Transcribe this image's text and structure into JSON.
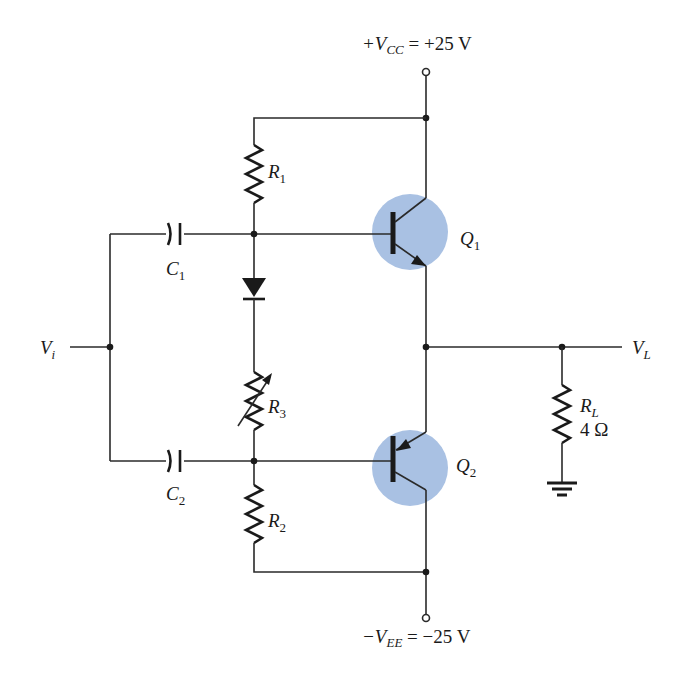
{
  "diagram": {
    "title": "",
    "type": "circuit-schematic",
    "colors": {
      "wire": "#2a2a2a",
      "transistor_highlight": "#a9c1e3",
      "background": "#ffffff"
    },
    "supplies": {
      "vcc": {
        "prefix": "+V",
        "sub": "CC",
        "value": " = +25 V"
      },
      "vee": {
        "prefix": "−V",
        "sub": "EE",
        "value": " = −25 V"
      }
    },
    "input": {
      "name": "V",
      "sub": "i"
    },
    "output": {
      "name": "V",
      "sub": "L"
    },
    "components": {
      "r1": {
        "name": "R",
        "sub": "1"
      },
      "r2": {
        "name": "R",
        "sub": "2"
      },
      "r3": {
        "name": "R",
        "sub": "3",
        "variable": true
      },
      "rl": {
        "name": "R",
        "sub": "L",
        "value": "4 Ω"
      },
      "c1": {
        "name": "C",
        "sub": "1"
      },
      "c2": {
        "name": "C",
        "sub": "2"
      },
      "d1": {
        "type": "diode"
      },
      "q1": {
        "name": "Q",
        "sub": "1",
        "type": "npn"
      },
      "q2": {
        "name": "Q",
        "sub": "2",
        "type": "pnp"
      }
    }
  }
}
